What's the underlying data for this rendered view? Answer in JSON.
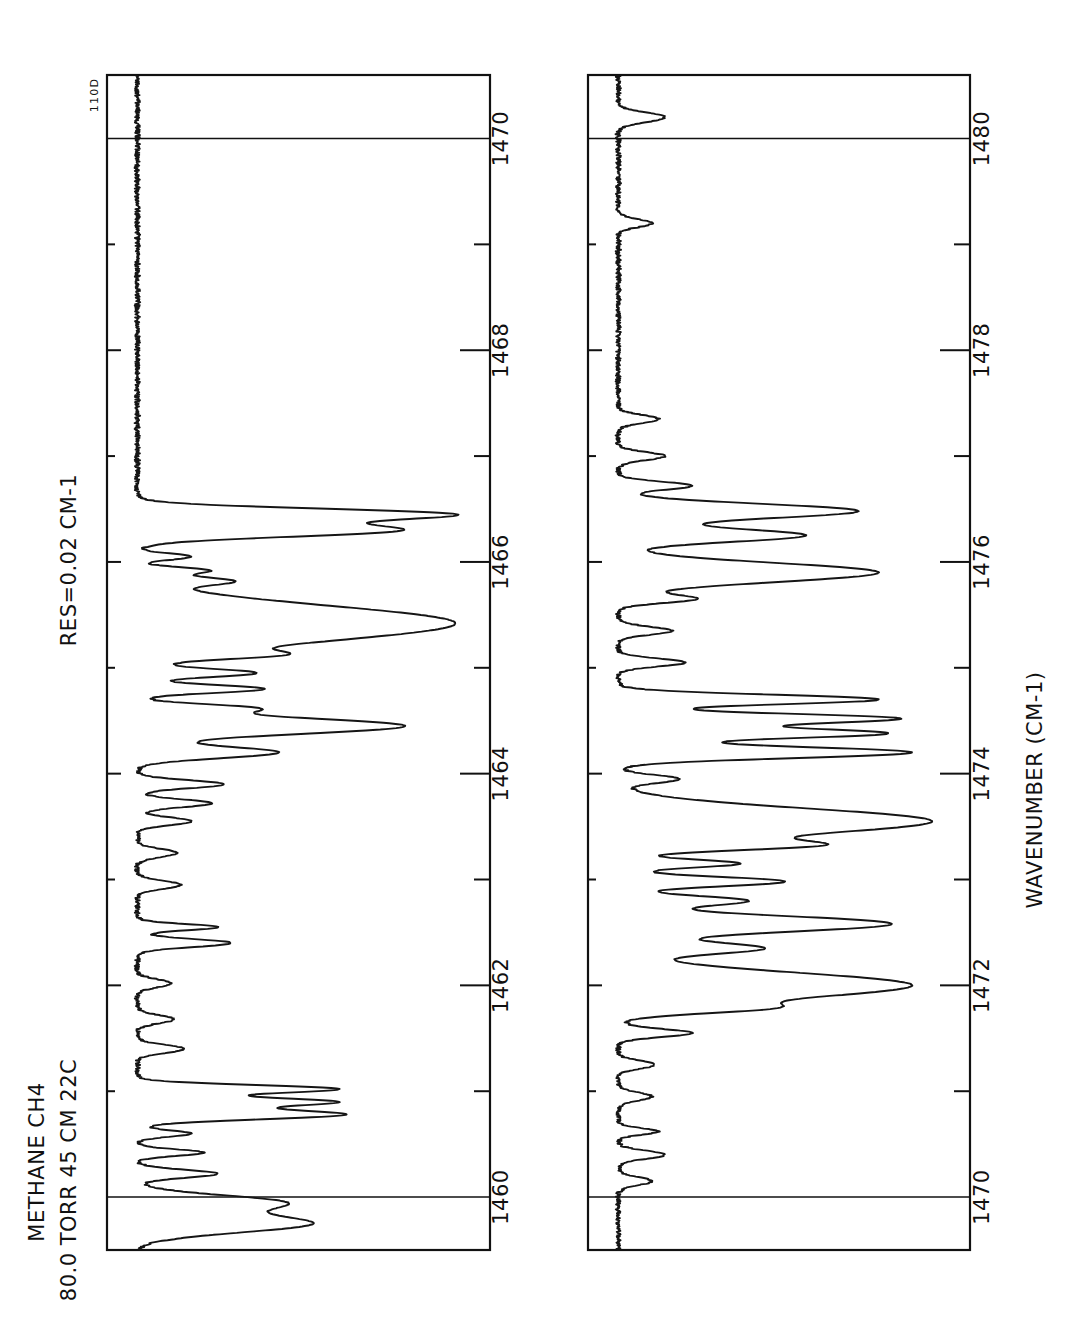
{
  "figure": {
    "id_label": "110D",
    "header": {
      "line1": "METHANE   CH4",
      "line2": "80.0 TORR  45 CM  22C",
      "resolution": "RES=0.02 CM-1"
    },
    "axis_label": "WAVENUMBER  (CM-1)"
  },
  "chart_data": {
    "type": "line",
    "title": "METHANE   CH4",
    "subtitle": "80.0 TORR  45 CM  22C",
    "annotations": [
      "RES=0.02 CM-1",
      "110D"
    ],
    "xlabel": "WAVENUMBER  (CM-1)",
    "ylabel": "TRANSMITTANCE",
    "orientation": "rotated-90-ccw",
    "grid": false,
    "legend": "none",
    "panels": [
      {
        "name": "upper-panel",
        "xlim": [
          1459.5,
          1470.6
        ],
        "ylim": [
          0.0,
          1.0
        ],
        "major_ticks": [
          1460,
          1462,
          1464,
          1466,
          1468,
          1470
        ],
        "minor_ticks": [
          1461,
          1463,
          1465,
          1467,
          1469
        ],
        "tick_labels": [
          "1460",
          "1462",
          "1464",
          "1466",
          "1468",
          "1470"
        ],
        "gridlines": [
          1460,
          1470
        ],
        "baseline": 0.97,
        "features": [
          {
            "center": 1459.75,
            "depth": 0.52,
            "width": 0.11
          },
          {
            "center": 1459.95,
            "depth": 0.42,
            "width": 0.09
          },
          {
            "center": 1460.22,
            "depth": 0.24,
            "width": 0.05
          },
          {
            "center": 1460.42,
            "depth": 0.2,
            "width": 0.04
          },
          {
            "center": 1460.6,
            "depth": 0.16,
            "width": 0.04
          },
          {
            "center": 1460.78,
            "depth": 0.62,
            "width": 0.06
          },
          {
            "center": 1460.9,
            "depth": 0.58,
            "width": 0.05
          },
          {
            "center": 1461.02,
            "depth": 0.6,
            "width": 0.05
          },
          {
            "center": 1461.4,
            "depth": 0.14,
            "width": 0.05
          },
          {
            "center": 1461.68,
            "depth": 0.11,
            "width": 0.05
          },
          {
            "center": 1462.02,
            "depth": 0.1,
            "width": 0.05
          },
          {
            "center": 1462.4,
            "depth": 0.28,
            "width": 0.05
          },
          {
            "center": 1462.55,
            "depth": 0.24,
            "width": 0.04
          },
          {
            "center": 1462.95,
            "depth": 0.13,
            "width": 0.05
          },
          {
            "center": 1463.25,
            "depth": 0.12,
            "width": 0.05
          },
          {
            "center": 1463.55,
            "depth": 0.16,
            "width": 0.05
          },
          {
            "center": 1463.72,
            "depth": 0.22,
            "width": 0.05
          },
          {
            "center": 1463.9,
            "depth": 0.26,
            "width": 0.05
          },
          {
            "center": 1464.2,
            "depth": 0.42,
            "width": 0.07
          },
          {
            "center": 1464.45,
            "depth": 0.8,
            "width": 0.1
          },
          {
            "center": 1464.62,
            "depth": 0.3,
            "width": 0.05
          },
          {
            "center": 1464.8,
            "depth": 0.38,
            "width": 0.05
          },
          {
            "center": 1464.95,
            "depth": 0.34,
            "width": 0.05
          },
          {
            "center": 1465.12,
            "depth": 0.26,
            "width": 0.05
          },
          {
            "center": 1465.42,
            "depth": 0.95,
            "width": 0.22
          },
          {
            "center": 1465.82,
            "depth": 0.24,
            "width": 0.05
          },
          {
            "center": 1465.92,
            "depth": 0.2,
            "width": 0.04
          },
          {
            "center": 1466.05,
            "depth": 0.16,
            "width": 0.04
          },
          {
            "center": 1466.3,
            "depth": 0.78,
            "width": 0.08
          },
          {
            "center": 1466.45,
            "depth": 0.92,
            "width": 0.07
          }
        ]
      },
      {
        "name": "lower-panel",
        "xlim": [
          1469.5,
          1480.6
        ],
        "ylim": [
          0.0,
          1.0
        ],
        "major_ticks": [
          1470,
          1472,
          1474,
          1476,
          1478,
          1480
        ],
        "minor_ticks": [
          1471,
          1473,
          1475,
          1477,
          1479
        ],
        "tick_labels": [
          "1470",
          "1472",
          "1474",
          "1476",
          "1478",
          "1480"
        ],
        "gridlines": [
          1470,
          1480
        ],
        "baseline": 0.97,
        "features": [
          {
            "center": 1470.15,
            "depth": 0.1,
            "width": 0.05
          },
          {
            "center": 1470.4,
            "depth": 0.14,
            "width": 0.05
          },
          {
            "center": 1470.62,
            "depth": 0.12,
            "width": 0.04
          },
          {
            "center": 1470.95,
            "depth": 0.1,
            "width": 0.05
          },
          {
            "center": 1471.25,
            "depth": 0.11,
            "width": 0.05
          },
          {
            "center": 1471.55,
            "depth": 0.22,
            "width": 0.05
          },
          {
            "center": 1471.78,
            "depth": 0.3,
            "width": 0.06
          },
          {
            "center": 1472.0,
            "depth": 0.88,
            "width": 0.16
          },
          {
            "center": 1472.35,
            "depth": 0.42,
            "width": 0.07
          },
          {
            "center": 1472.58,
            "depth": 0.82,
            "width": 0.1
          },
          {
            "center": 1472.8,
            "depth": 0.38,
            "width": 0.06
          },
          {
            "center": 1472.98,
            "depth": 0.5,
            "width": 0.06
          },
          {
            "center": 1473.15,
            "depth": 0.36,
            "width": 0.05
          },
          {
            "center": 1473.32,
            "depth": 0.46,
            "width": 0.06
          },
          {
            "center": 1473.55,
            "depth": 0.94,
            "width": 0.16
          },
          {
            "center": 1473.95,
            "depth": 0.18,
            "width": 0.05
          },
          {
            "center": 1474.2,
            "depth": 0.88,
            "width": 0.07
          },
          {
            "center": 1474.38,
            "depth": 0.8,
            "width": 0.06
          },
          {
            "center": 1474.52,
            "depth": 0.84,
            "width": 0.06
          },
          {
            "center": 1474.7,
            "depth": 0.78,
            "width": 0.06
          },
          {
            "center": 1475.05,
            "depth": 0.2,
            "width": 0.05
          },
          {
            "center": 1475.35,
            "depth": 0.16,
            "width": 0.05
          },
          {
            "center": 1475.65,
            "depth": 0.22,
            "width": 0.05
          },
          {
            "center": 1475.9,
            "depth": 0.78,
            "width": 0.12
          },
          {
            "center": 1476.25,
            "depth": 0.56,
            "width": 0.08
          },
          {
            "center": 1476.48,
            "depth": 0.72,
            "width": 0.09
          },
          {
            "center": 1476.72,
            "depth": 0.22,
            "width": 0.05
          },
          {
            "center": 1477.0,
            "depth": 0.14,
            "width": 0.05
          },
          {
            "center": 1477.35,
            "depth": 0.12,
            "width": 0.05
          },
          {
            "center": 1479.2,
            "depth": 0.1,
            "width": 0.05
          },
          {
            "center": 1480.2,
            "depth": 0.14,
            "width": 0.06
          }
        ]
      }
    ]
  }
}
